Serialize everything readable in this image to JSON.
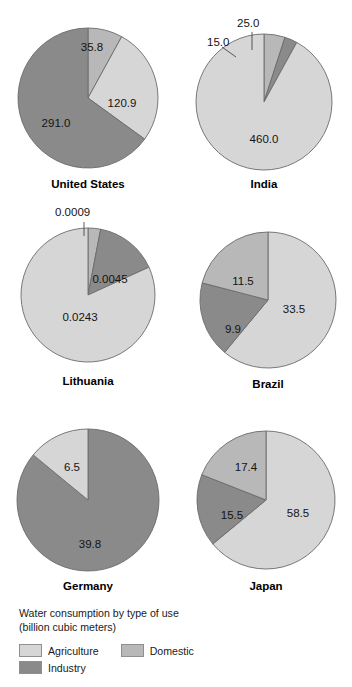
{
  "chart_data": {
    "type": "pie",
    "title": "Water consumption by type of use",
    "subtitle": "(billion cubic meters)",
    "categories": [
      "Agriculture",
      "Domestic",
      "Industry"
    ],
    "colors": {
      "Agriculture": "#d6d6d6",
      "Domestic": "#b8b8b8",
      "Industry": "#8a8a8a",
      "outline": "#6b6b6b",
      "background": "#ffffff",
      "text": "#141414"
    },
    "units": "billion cubic meters",
    "charts": [
      {
        "name": "United States",
        "total": 447.7,
        "slices": [
          {
            "category": "Domestic",
            "value": 35.8,
            "label": "35.8"
          },
          {
            "category": "Agriculture",
            "value": 120.9,
            "label": "120.9"
          },
          {
            "category": "Industry",
            "value": 291.0,
            "label": "291.0"
          }
        ]
      },
      {
        "name": "India",
        "total": 500.0,
        "slices": [
          {
            "category": "Domestic",
            "value": 25.0,
            "label": "25.0"
          },
          {
            "category": "Industry",
            "value": 15.0,
            "label": "15.0"
          },
          {
            "category": "Agriculture",
            "value": 460.0,
            "label": "460.0"
          }
        ]
      },
      {
        "name": "Lithuania",
        "total": 0.0297,
        "slices": [
          {
            "category": "Domestic",
            "value": 0.0009,
            "label": "0.0009"
          },
          {
            "category": "Industry",
            "value": 0.0045,
            "label": "0.0045"
          },
          {
            "category": "Agriculture",
            "value": 0.0243,
            "label": "0.0243"
          }
        ]
      },
      {
        "name": "Brazil",
        "total": 54.9,
        "slices": [
          {
            "category": "Agriculture",
            "value": 33.5,
            "label": "33.5"
          },
          {
            "category": "Industry",
            "value": 9.9,
            "label": "9.9"
          },
          {
            "category": "Domestic",
            "value": 11.5,
            "label": "11.5"
          }
        ]
      },
      {
        "name": "Germany",
        "total": 46.3,
        "slices": [
          {
            "category": "Industry",
            "value": 39.8,
            "label": "39.8"
          },
          {
            "category": "Agriculture",
            "value": 6.5,
            "label": "6.5"
          }
        ]
      },
      {
        "name": "Japan",
        "total": 91.4,
        "slices": [
          {
            "category": "Agriculture",
            "value": 58.5,
            "label": "58.5"
          },
          {
            "category": "Industry",
            "value": 15.5,
            "label": "15.5"
          },
          {
            "category": "Domestic",
            "value": 17.4,
            "label": "17.4"
          }
        ]
      }
    ]
  },
  "legend": {
    "title_line1": "Water consumption by type of use",
    "title_line2": "(billion cubic meters)",
    "entries": [
      {
        "label": "Agriculture",
        "color": "#d6d6d6"
      },
      {
        "label": "Domestic",
        "color": "#b8b8b8"
      },
      {
        "label": "Industry",
        "color": "#8a8a8a"
      }
    ]
  }
}
